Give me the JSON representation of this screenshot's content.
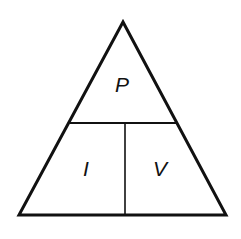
{
  "diagram": {
    "type": "formula-triangle",
    "colors": {
      "stroke": "#111111",
      "background": "#ffffff"
    },
    "triangle": {
      "apex": [
        123,
        22
      ],
      "base_left": [
        19,
        215
      ],
      "base_right": [
        226,
        215
      ],
      "stroke_width": 3
    },
    "dividers": {
      "horizontal": {
        "y": 123,
        "x1": 70,
        "x2": 176,
        "stroke_width": 2
      },
      "vertical": {
        "x": 125,
        "y1": 123,
        "y2": 215,
        "stroke_width": 1.6
      }
    },
    "labels": {
      "top": {
        "text": "P",
        "x": 122,
        "y": 92
      },
      "bottom_left": {
        "text": "I",
        "x": 86,
        "y": 176
      },
      "bottom_right": {
        "text": "V",
        "x": 160,
        "y": 176
      }
    }
  }
}
